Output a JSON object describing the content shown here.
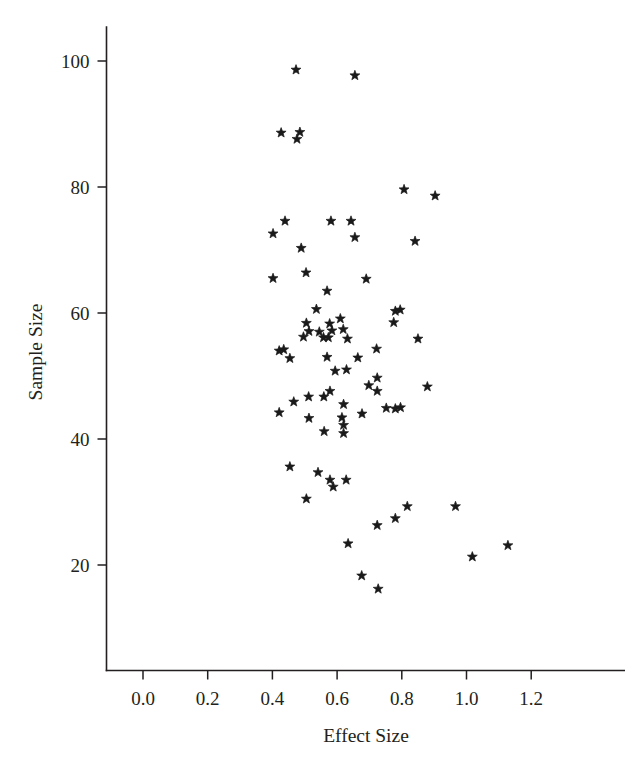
{
  "chart_data": {
    "type": "scatter",
    "title": "",
    "xlabel": "Effect Size",
    "ylabel": "Sample Size",
    "xlim": [
      -0.13,
      1.34
    ],
    "ylim": [
      11.5,
      103.5
    ],
    "grid": false,
    "legend": null,
    "marker": "star",
    "marker_color": "#1a1a1a",
    "xticks": [
      0.0,
      0.2,
      0.4,
      0.6,
      0.8,
      1.0,
      1.2
    ],
    "xtick_labels": [
      "0.0",
      "0.2",
      "0.4",
      "0.6",
      "0.8",
      "1.0",
      "1.2"
    ],
    "yticks": [
      20,
      40,
      60,
      80,
      100
    ],
    "ytick_labels": [
      "20",
      "40",
      "60",
      "80",
      "100"
    ],
    "n_points": 76,
    "points": [
      {
        "x": 0.473,
        "y": 98.6
      },
      {
        "x": 0.655,
        "y": 97.7
      },
      {
        "x": 0.427,
        "y": 88.6
      },
      {
        "x": 0.485,
        "y": 88.7
      },
      {
        "x": 0.476,
        "y": 87.6
      },
      {
        "x": 0.807,
        "y": 79.6
      },
      {
        "x": 0.903,
        "y": 78.6
      },
      {
        "x": 0.439,
        "y": 74.6
      },
      {
        "x": 0.581,
        "y": 74.6
      },
      {
        "x": 0.643,
        "y": 74.6
      },
      {
        "x": 0.402,
        "y": 72.6
      },
      {
        "x": 0.655,
        "y": 72.0
      },
      {
        "x": 0.841,
        "y": 71.4
      },
      {
        "x": 0.489,
        "y": 70.3
      },
      {
        "x": 0.504,
        "y": 66.4
      },
      {
        "x": 0.402,
        "y": 65.5
      },
      {
        "x": 0.69,
        "y": 65.4
      },
      {
        "x": 0.569,
        "y": 63.5
      },
      {
        "x": 0.536,
        "y": 60.6
      },
      {
        "x": 0.78,
        "y": 60.3
      },
      {
        "x": 0.795,
        "y": 60.5
      },
      {
        "x": 0.775,
        "y": 58.5
      },
      {
        "x": 0.505,
        "y": 58.4
      },
      {
        "x": 0.577,
        "y": 58.3
      },
      {
        "x": 0.513,
        "y": 57.1
      },
      {
        "x": 0.545,
        "y": 57.0
      },
      {
        "x": 0.584,
        "y": 57.2
      },
      {
        "x": 0.619,
        "y": 57.4
      },
      {
        "x": 0.496,
        "y": 56.2
      },
      {
        "x": 0.558,
        "y": 56.1
      },
      {
        "x": 0.573,
        "y": 56.1
      },
      {
        "x": 0.632,
        "y": 55.9
      },
      {
        "x": 0.85,
        "y": 55.9
      },
      {
        "x": 0.722,
        "y": 54.3
      },
      {
        "x": 0.421,
        "y": 54.0
      },
      {
        "x": 0.435,
        "y": 54.2
      },
      {
        "x": 0.454,
        "y": 52.8
      },
      {
        "x": 0.569,
        "y": 53.0
      },
      {
        "x": 0.664,
        "y": 52.9
      },
      {
        "x": 0.629,
        "y": 51.0
      },
      {
        "x": 0.724,
        "y": 49.7
      },
      {
        "x": 0.879,
        "y": 48.3
      },
      {
        "x": 0.698,
        "y": 48.5
      },
      {
        "x": 0.578,
        "y": 47.6
      },
      {
        "x": 0.724,
        "y": 47.6
      },
      {
        "x": 0.512,
        "y": 46.7
      },
      {
        "x": 0.559,
        "y": 46.7
      },
      {
        "x": 0.466,
        "y": 45.9
      },
      {
        "x": 0.62,
        "y": 45.5
      },
      {
        "x": 0.78,
        "y": 44.8
      },
      {
        "x": 0.796,
        "y": 45.0
      },
      {
        "x": 0.421,
        "y": 44.2
      },
      {
        "x": 0.513,
        "y": 43.3
      },
      {
        "x": 0.615,
        "y": 43.4
      },
      {
        "x": 0.677,
        "y": 44.0
      },
      {
        "x": 0.62,
        "y": 42.2
      },
      {
        "x": 0.56,
        "y": 41.2
      },
      {
        "x": 0.62,
        "y": 40.9
      },
      {
        "x": 0.454,
        "y": 35.6
      },
      {
        "x": 0.541,
        "y": 34.7
      },
      {
        "x": 0.578,
        "y": 33.5
      },
      {
        "x": 0.628,
        "y": 33.5
      },
      {
        "x": 0.588,
        "y": 32.4
      },
      {
        "x": 0.505,
        "y": 30.5
      },
      {
        "x": 0.817,
        "y": 29.3
      },
      {
        "x": 0.966,
        "y": 29.3
      },
      {
        "x": 0.78,
        "y": 27.4
      },
      {
        "x": 0.724,
        "y": 26.3
      },
      {
        "x": 0.634,
        "y": 23.4
      },
      {
        "x": 1.128,
        "y": 23.1
      },
      {
        "x": 1.018,
        "y": 21.3
      },
      {
        "x": 0.676,
        "y": 18.3
      },
      {
        "x": 0.727,
        "y": 16.2
      },
      {
        "x": 0.752,
        "y": 44.9
      },
      {
        "x": 0.594,
        "y": 50.8
      },
      {
        "x": 0.61,
        "y": 59.1
      }
    ]
  },
  "axes": {
    "x_axis_name": "x-axis",
    "y_axis_name": "y-axis"
  }
}
